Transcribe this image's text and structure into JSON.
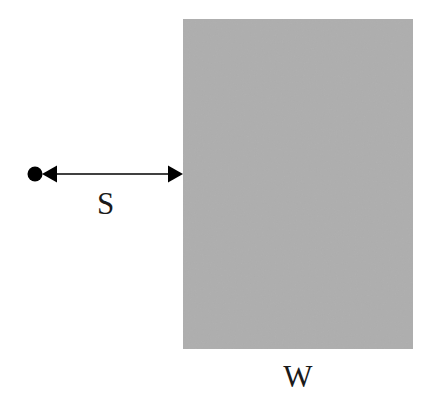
{
  "figure": {
    "background_color": "#ffffff",
    "stroke_color": "#000000",
    "title": "",
    "region": {
      "name": "gray-rectangle",
      "label": "W",
      "fill_color": "#aaaaaa",
      "x": 183,
      "y": 19,
      "width": 230,
      "height": 330,
      "texture": "noise"
    },
    "point": {
      "name": "source-point",
      "shape": "filled-circle",
      "color": "#000000",
      "cx": 35,
      "cy": 174,
      "radius": 7.5
    },
    "measurement": {
      "name": "separation-arrow",
      "label": "S",
      "arrow_style": "double-headed",
      "y": 174,
      "x_start": 35,
      "x_end": 183,
      "line_width": 1.6,
      "arrowhead_length": 15,
      "arrowhead_half_width": 8.5
    },
    "labels": {
      "distance": "S",
      "width": "W"
    }
  }
}
